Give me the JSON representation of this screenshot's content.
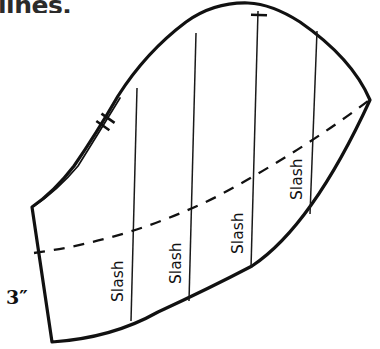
{
  "figure": {
    "name": "sleeve-pattern-slash-diagram",
    "type": "technical-sewing-pattern-line-drawing",
    "caption_fragment": "lines.",
    "dimension_label": "3″",
    "slash_labels": [
      "Slash",
      "Slash",
      "Slash",
      "Slash"
    ],
    "colors": {
      "outline": "#111111",
      "interior_line": "#1a1a1a",
      "dashed_line": "#111111",
      "background": "#ffffff",
      "text": "#111111"
    },
    "geometry": {
      "outline_path": "M 32 207 L 52 342 Q 160 330 250 268 Q 320 218 370 100 Q 345 42 292 10 Q 250 -4 212 8 Q 150 34 112 100 Q 88 132 70 170 Q 52 190 32 207 Z",
      "sliver_path": "M 33 206 Q 60 186 80 163 Q 100 122 120 93",
      "bottom_edge_note": "curve from bottom-left corner rising to the right tip",
      "slash_lines": [
        {
          "x1": 137,
          "y1": 88,
          "x2": 131,
          "y2": 320
        },
        {
          "x1": 196,
          "y1": 33,
          "x2": 188,
          "y2": 300
        },
        {
          "x1": 258,
          "y1": 11,
          "x2": 250,
          "y2": 268
        },
        {
          "x1": 317,
          "y1": 31,
          "x2": 309,
          "y2": 213
        }
      ],
      "dashed_fold_line": "M 34 253 Q 140 238 240 185 Q 310 146 368 101",
      "notches": [
        {
          "name": "double-notch-upper-left",
          "x": 105,
          "y": 122,
          "angle": -57,
          "count": 2
        },
        {
          "name": "single-notch-top",
          "x": 260,
          "y": 15,
          "angle": 2,
          "count": 1
        }
      ],
      "slash_label_positions": [
        {
          "x": 121,
          "y": 300,
          "rotate": -90
        },
        {
          "x": 178,
          "y": 282,
          "rotate": -90
        },
        {
          "x": 240,
          "y": 252,
          "rotate": -90
        },
        {
          "x": 299,
          "y": 198,
          "rotate": -90
        }
      ]
    }
  }
}
